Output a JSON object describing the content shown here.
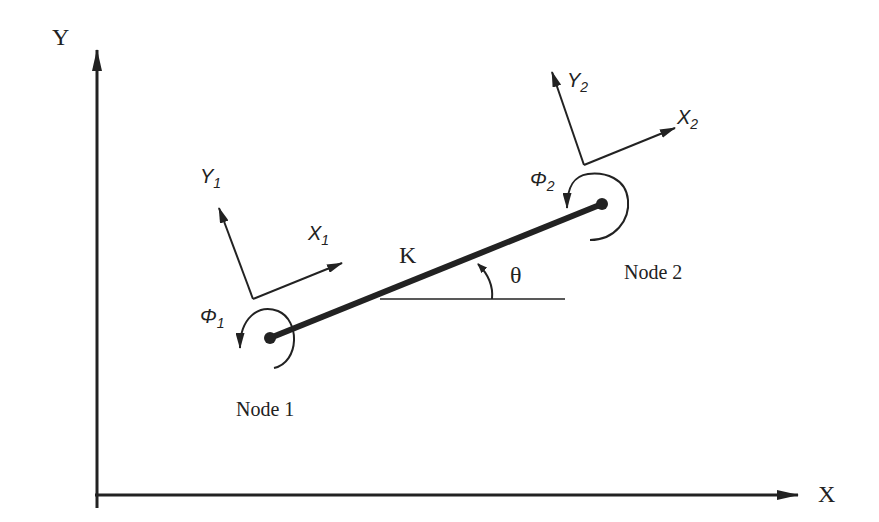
{
  "diagram": {
    "axes": {
      "x_label": "X",
      "y_label": "Y"
    },
    "element": {
      "stiffness_label": "K",
      "angle_label": "θ"
    },
    "node1": {
      "label": "Node 1",
      "local_x": {
        "base": "X",
        "sub": "1"
      },
      "local_y": {
        "base": "Y",
        "sub": "1"
      },
      "rotation": {
        "base": "Φ",
        "sub": "1"
      }
    },
    "node2": {
      "label": "Node 2",
      "local_x": {
        "base": "X",
        "sub": "2"
      },
      "local_y": {
        "base": "Y",
        "sub": "2"
      },
      "rotation": {
        "base": "Φ",
        "sub": "2"
      }
    },
    "colors": {
      "stroke": "#222222",
      "background": "#ffffff"
    }
  }
}
